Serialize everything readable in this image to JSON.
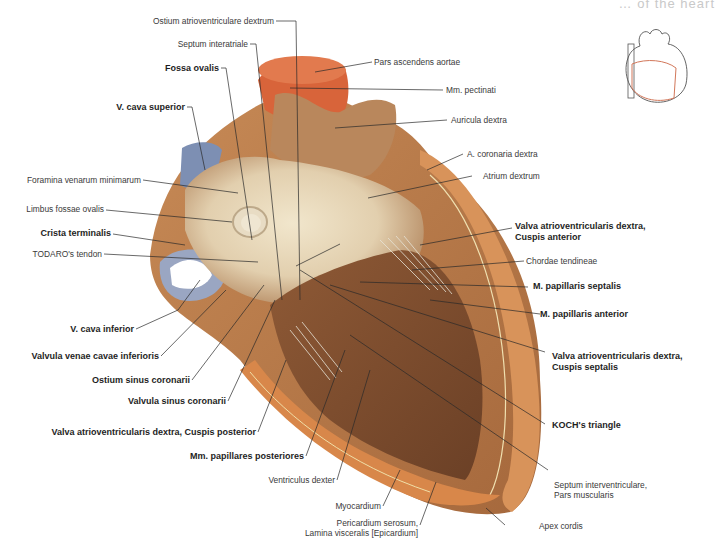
{
  "header": {
    "title_fragment": "… of the heart"
  },
  "figure": {
    "colors": {
      "myocardium": "#b97a4a",
      "endocardium_light": "#e9dcc0",
      "aorta": "#d9643a",
      "vena_cava": "#7d8fb3",
      "cut_surface": "#d9874a",
      "trabeculae_dark": "#7a4a2a"
    }
  },
  "labels_left": [
    {
      "id": "ostium-av",
      "text": "Ostium atrioventriculare dextrum",
      "bold": false
    },
    {
      "id": "septum-interatriale",
      "text": "Septum interatriale",
      "bold": false
    },
    {
      "id": "fossa-ovalis",
      "text": "Fossa ovalis",
      "bold": true
    },
    {
      "id": "v-cava-superior",
      "text": "V. cava superior",
      "bold": true
    },
    {
      "id": "foramina",
      "text": "Foramina venarum minimarum",
      "bold": false
    },
    {
      "id": "limbus",
      "text": "Limbus fossae ovalis",
      "bold": false
    },
    {
      "id": "crista",
      "text": "Crista terminalis",
      "bold": true
    },
    {
      "id": "todaro",
      "text": "TODARO's tendon",
      "bold": false
    },
    {
      "id": "v-cava-inferior",
      "text": "V. cava inferior",
      "bold": true
    },
    {
      "id": "valvula-vci",
      "text": "Valvula venae cavae inferioris",
      "bold": true
    },
    {
      "id": "ostium-sinus",
      "text": "Ostium sinus coronarii",
      "bold": true
    },
    {
      "id": "valvula-sinus",
      "text": "Valvula sinus coronarii",
      "bold": true
    },
    {
      "id": "cuspis-posterior",
      "text": "Valva atrioventricularis dextra, Cuspis posterior",
      "bold": true
    },
    {
      "id": "mm-pap-post",
      "text": "Mm. papillares posteriores",
      "bold": true
    },
    {
      "id": "ventriculus",
      "text": "Ventriculus dexter",
      "bold": false
    },
    {
      "id": "myocardium",
      "text": "Myocardium",
      "bold": false
    },
    {
      "id": "pericardium",
      "text": "Pericardium serosum,",
      "text2": "Lamina visceralis [Epicardium]",
      "bold": false
    }
  ],
  "labels_right": [
    {
      "id": "aorta",
      "text": "Pars ascendens aortae",
      "bold": false
    },
    {
      "id": "mm-pectinati",
      "text": "Mm. pectinati",
      "bold": false
    },
    {
      "id": "auricula",
      "text": "Auricula dextra",
      "bold": false
    },
    {
      "id": "a-coronaria",
      "text": "A. coronaria dextra",
      "bold": false
    },
    {
      "id": "atrium",
      "text": "Atrium dextrum",
      "bold": false
    },
    {
      "id": "cuspis-anterior",
      "text": "Valva atrioventricularis dextra,",
      "text2": "Cuspis anterior",
      "bold": true
    },
    {
      "id": "chordae",
      "text": "Chordae tendineae",
      "bold": false
    },
    {
      "id": "m-pap-sept",
      "text": "M. papillaris septalis",
      "bold": true
    },
    {
      "id": "m-pap-ant",
      "text": "M. papillaris anterior",
      "bold": true
    },
    {
      "id": "cuspis-septalis",
      "text": "Valva atrioventricularis dextra,",
      "text2": "Cuspis septalis",
      "bold": true
    },
    {
      "id": "koch",
      "text": "KOCH's triangle",
      "bold": true
    },
    {
      "id": "septum-iv",
      "text": "Septum interventriculare,",
      "text2": "Pars muscularis",
      "bold": false
    },
    {
      "id": "apex",
      "text": "Apex cordis",
      "bold": false
    }
  ],
  "thumbnail": {
    "description": "Orientation sketch of heart with red outline of opened region"
  }
}
